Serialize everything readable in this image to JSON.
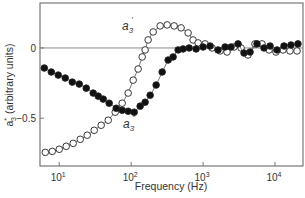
{
  "chart_data": {
    "type": "scatter",
    "title": "",
    "xlabel": "Frequency (Hz)",
    "ylabel": "a*3 (arbitrary units)",
    "ylabel_main": "a",
    "ylabel_sup": "*",
    "ylabel_sub": "3",
    "ylabel_rest": " (arbitrary units)",
    "x_scale": "log",
    "xlim": [
      5.4,
      24500
    ],
    "ylim": [
      -0.84,
      0.32
    ],
    "grid": false,
    "zero_line": true,
    "x_ticks": [
      {
        "value": 10,
        "base": "10",
        "exp": "1"
      },
      {
        "value": 100,
        "base": "10",
        "exp": "2"
      },
      {
        "value": 1000,
        "base": "10",
        "exp": "3"
      },
      {
        "value": 10000,
        "base": "10",
        "exp": "4"
      }
    ],
    "y_ticks": [
      {
        "value": 0,
        "label": "0"
      },
      {
        "value": -0.5,
        "label": "−0.5"
      }
    ],
    "series": [
      {
        "name": "a3'",
        "label_main": "a",
        "label_sub": "3",
        "label_prime": "′",
        "marker": "open-circle",
        "connected": true,
        "log10_x": [
          0.806,
          0.903,
          1.0,
          1.097,
          1.194,
          1.292,
          1.389,
          1.486,
          1.583,
          1.681,
          1.778,
          1.875,
          1.958,
          2.028,
          2.097,
          2.153,
          2.194,
          2.236,
          2.306,
          2.403,
          2.5,
          2.597,
          2.694,
          2.792,
          2.861,
          2.931,
          3.028,
          3.125,
          3.236,
          3.333,
          3.431,
          3.528,
          3.625,
          3.722,
          3.819,
          3.917,
          4.014,
          4.111,
          4.208,
          4.306
        ],
        "y": [
          -0.743,
          -0.736,
          -0.721,
          -0.7,
          -0.679,
          -0.65,
          -0.621,
          -0.586,
          -0.55,
          -0.514,
          -0.457,
          -0.393,
          -0.321,
          -0.229,
          -0.15,
          -0.064,
          -0.014,
          0.057,
          0.114,
          0.157,
          0.164,
          0.157,
          0.143,
          0.107,
          0.057,
          0.036,
          0.029,
          0.0,
          -0.021,
          -0.029,
          0.007,
          0.0,
          -0.05,
          0.029,
          0.029,
          -0.014,
          -0.029,
          -0.014,
          -0.021,
          -0.021
        ]
      },
      {
        "name": "a3''",
        "label_main": "a",
        "label_sub": "3",
        "label_prime": "″",
        "marker": "filled-circle",
        "connected": true,
        "log10_x": [
          0.792,
          0.889,
          0.986,
          1.083,
          1.181,
          1.278,
          1.375,
          1.472,
          1.542,
          1.611,
          1.694,
          1.792,
          1.875,
          1.958,
          2.042,
          2.125,
          2.194,
          2.264,
          2.347,
          2.431,
          2.514,
          2.583,
          2.653,
          2.722,
          2.806,
          2.903,
          3.0,
          3.097,
          3.208,
          3.306,
          3.389,
          3.486,
          3.569,
          3.653,
          3.75,
          3.847,
          3.931,
          4.028,
          4.125,
          4.222,
          4.319
        ],
        "y": [
          -0.143,
          -0.171,
          -0.193,
          -0.214,
          -0.243,
          -0.257,
          -0.286,
          -0.321,
          -0.343,
          -0.364,
          -0.393,
          -0.429,
          -0.443,
          -0.45,
          -0.457,
          -0.414,
          -0.386,
          -0.336,
          -0.264,
          -0.171,
          -0.086,
          -0.064,
          -0.014,
          -0.007,
          0.0,
          -0.007,
          0.007,
          0.014,
          -0.014,
          0.007,
          0.007,
          0.029,
          -0.036,
          -0.029,
          0.029,
          0.0,
          0.014,
          -0.014,
          0.014,
          0.021,
          0.029
        ]
      }
    ]
  }
}
